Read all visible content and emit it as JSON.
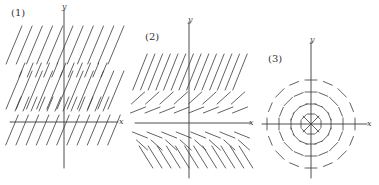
{
  "figure": {
    "ink_color": "#3a3a3a",
    "panels": [
      {
        "id": 1,
        "label": "(1)",
        "label_pos": [
          11,
          8
        ],
        "x_axis_label": "x",
        "y_axis_label": "y",
        "origin": [
          64,
          122
        ],
        "x_axis": [
          10,
          118
        ],
        "y_axis": [
          10,
          168
        ],
        "x_label_pos": [
          119,
          118
        ],
        "y_label_pos": [
          62,
          3
        ],
        "field": "parallel_slope",
        "rows": [
          {
            "y": 45,
            "x0": 14,
            "x1": 116,
            "count": 11,
            "dy": 38,
            "slope": 2.4
          },
          {
            "y": 70,
            "x0": 22,
            "x1": 104,
            "count": 11,
            "dy": 14,
            "slope": 2.4
          },
          {
            "y": 90,
            "x0": 14,
            "x1": 116,
            "count": 11,
            "dy": 38,
            "slope": 2.4
          },
          {
            "y": 104,
            "x0": 18,
            "x1": 106,
            "count": 12,
            "dy": 14,
            "slope": 2.4
          },
          {
            "y": 130,
            "x0": 12,
            "x1": 114,
            "count": 11,
            "dy": 30,
            "slope": 2.4
          }
        ]
      },
      {
        "id": 2,
        "label": "(2)",
        "label_pos": [
          145,
          32
        ],
        "x_axis_label": "x",
        "y_axis_label": "y",
        "origin": [
          189,
          123
        ],
        "x_axis": [
          135,
          251
        ],
        "y_axis": [
          22,
          178
        ],
        "x_label_pos": [
          249,
          119
        ],
        "y_label_pos": [
          188,
          16
        ],
        "field": "varying_slope",
        "rows": [
          {
            "y": 72,
            "x0": 140,
            "x1": 240,
            "count": 14,
            "dy": 36,
            "slope": 2.5
          },
          {
            "y": 98,
            "x0": 138,
            "x1": 238,
            "count": 8,
            "dy": 12,
            "slope": 0.9
          },
          {
            "y": 110,
            "x0": 138,
            "x1": 240,
            "count": 8,
            "dy": 6,
            "slope": 0.4
          },
          {
            "y": 135,
            "x0": 140,
            "x1": 242,
            "count": 8,
            "dy": 6,
            "slope": -0.4
          },
          {
            "y": 145,
            "x0": 142,
            "x1": 244,
            "count": 8,
            "dy": 10,
            "slope": -0.9
          },
          {
            "y": 157,
            "x0": 146,
            "x1": 246,
            "count": 12,
            "dy": 22,
            "slope": -1.6
          }
        ]
      },
      {
        "id": 3,
        "label": "(3)",
        "label_pos": [
          268,
          54
        ],
        "x_axis_label": "x",
        "y_axis_label": "y",
        "origin": [
          311,
          124
        ],
        "x_axis": [
          262,
          367
        ],
        "y_axis": [
          42,
          178
        ],
        "x_label_pos": [
          367,
          120
        ],
        "y_label_pos": [
          310,
          36
        ],
        "field": "concentric_isoclines",
        "rings": [
          {
            "r": 10,
            "seg": 7
          },
          {
            "r": 20,
            "seg": 10
          },
          {
            "r": 32,
            "seg": 12
          },
          {
            "r": 44,
            "seg": 12
          }
        ]
      }
    ]
  }
}
